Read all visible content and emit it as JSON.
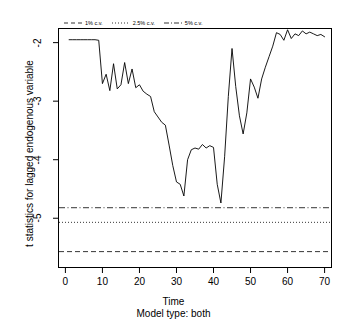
{
  "chart_data": {
    "type": "line",
    "title": "",
    "xlabel": "Time",
    "subtitle": "Model type: both",
    "ylabel": "t statistics for lagged endogenous variable",
    "xlim": [
      -2,
      72
    ],
    "ylim": [
      -5.85,
      -1.75
    ],
    "xticks": [
      0,
      10,
      20,
      30,
      40,
      50,
      60,
      70
    ],
    "yticks": [
      -2,
      -3,
      -4,
      -5
    ],
    "grid": false,
    "legend_position": "top-inside-left",
    "series": [
      {
        "name": "t statistic",
        "style": "solid",
        "x": [
          1,
          2,
          3,
          4,
          5,
          6,
          7,
          8,
          9,
          10,
          11,
          12,
          13,
          14,
          15,
          16,
          17,
          18,
          19,
          20,
          21,
          22,
          23,
          24,
          25,
          26,
          27,
          28,
          29,
          30,
          31,
          32,
          33,
          34,
          35,
          36,
          37,
          38,
          39,
          40,
          41,
          42,
          43,
          44,
          45,
          46,
          47,
          48,
          49,
          50,
          51,
          52,
          53,
          54,
          55,
          56,
          57,
          58,
          59,
          60,
          61,
          62,
          63,
          64,
          65,
          66,
          67,
          68,
          69,
          70
        ],
        "values": [
          -1.95,
          -1.95,
          -1.95,
          -1.95,
          -1.95,
          -1.95,
          -1.95,
          -1.95,
          -1.96,
          -2.7,
          -2.54,
          -2.82,
          -2.36,
          -2.79,
          -2.72,
          -2.34,
          -2.7,
          -2.45,
          -2.77,
          -2.72,
          -2.83,
          -2.88,
          -2.92,
          -3.18,
          -3.27,
          -3.36,
          -3.41,
          -3.75,
          -4.1,
          -4.38,
          -4.42,
          -4.62,
          -4.0,
          -3.83,
          -3.8,
          -3.82,
          -3.74,
          -3.8,
          -3.76,
          -3.79,
          -4.42,
          -4.74,
          -3.95,
          -2.92,
          -2.1,
          -2.75,
          -3.25,
          -3.56,
          -3.2,
          -2.62,
          -2.76,
          -2.95,
          -2.62,
          -2.42,
          -2.24,
          -2.06,
          -1.83,
          -1.86,
          -1.96,
          -1.78,
          -1.93,
          -1.85,
          -1.88,
          -1.8,
          -1.85,
          -1.82,
          -1.85,
          -1.88,
          -1.86,
          -1.9
        ]
      }
    ],
    "critical_values": [
      {
        "label": "1% c.v.",
        "value": -5.57,
        "style": "dashed"
      },
      {
        "label": "2.5% c.v.",
        "value": -5.07,
        "style": "dotted"
      },
      {
        "label": "5% c.v.",
        "value": -4.82,
        "style": "dashdot"
      }
    ],
    "line_color": "#000000"
  },
  "legend": {
    "items": [
      {
        "label": "1% c.v.",
        "style": "dashed"
      },
      {
        "label": "2.5% c.v.",
        "style": "dotted"
      },
      {
        "label": "5% c.v.",
        "style": "dashdot"
      }
    ]
  }
}
